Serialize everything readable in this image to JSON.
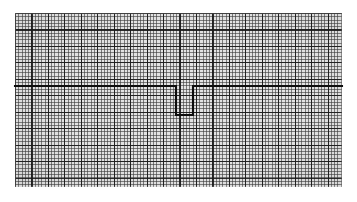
{
  "document": {
    "kind": "ecg-rhythm-strip",
    "title": "ECG rhythm strip",
    "caption": ""
  },
  "paper": {
    "name": "ecg-graph-paper",
    "background_color": "#e2e2e2",
    "minor_line_color": "#3c3c3c",
    "major_line_color": "#191919",
    "minor_grid_px": 3.29,
    "major_grid_px": 16.45,
    "minor_per_major": 5,
    "paper_left_px": 15,
    "paper_top_px": 13,
    "paper_width_px": 327,
    "paper_height_px": 174
  },
  "trace": {
    "name": "ecg-waveform",
    "color": "#0d0d0d",
    "stroke_width_px": 2.1,
    "baseline_y_px": 86,
    "description": "Flat isoelectric baseline interrupted by a single deep square negative deflection (QS complex)",
    "points": [
      {
        "x": 15,
        "y": 86
      },
      {
        "x": 176,
        "y": 86
      },
      {
        "x": 176,
        "y": 115
      },
      {
        "x": 193,
        "y": 115
      },
      {
        "x": 193,
        "y": 86
      },
      {
        "x": 342,
        "y": 86
      }
    ]
  },
  "chart_data": {
    "type": "line",
    "title": "ECG rhythm strip",
    "xlabel": "",
    "ylabel": "",
    "grid": true,
    "legend_position": "none",
    "xlim": [
      15,
      342
    ],
    "ylim": [
      187,
      13
    ],
    "series": [
      {
        "name": "ECG lead",
        "x": [
          15,
          176,
          176,
          193,
          193,
          342
        ],
        "y": [
          86,
          86,
          115,
          115,
          86,
          86
        ]
      }
    ],
    "annotations": []
  }
}
